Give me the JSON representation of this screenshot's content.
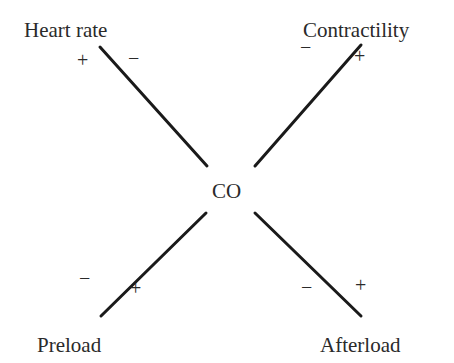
{
  "diagram": {
    "center": {
      "label": "CO",
      "x": 230,
      "y": 192
    },
    "line_color": "#1a1a1a",
    "text_color": "#2a2a2a",
    "nodes": [
      {
        "id": "heart-rate",
        "label": "Heart rate",
        "x": 24,
        "y": 20,
        "line": {
          "x1": 100,
          "y1": 47,
          "x2": 207,
          "y2": 166
        },
        "signs": [
          {
            "s": "+",
            "x": 83,
            "y": 60
          },
          {
            "s": "−",
            "x": 134,
            "y": 58
          }
        ]
      },
      {
        "id": "contractility",
        "label": "Contractility",
        "x": 303,
        "y": 20,
        "line": {
          "x1": 361,
          "y1": 45,
          "x2": 255,
          "y2": 166
        },
        "signs": [
          {
            "s": "−",
            "x": 306,
            "y": 47
          },
          {
            "s": "+",
            "x": 360,
            "y": 56
          }
        ]
      },
      {
        "id": "preload",
        "label": "Preload",
        "x": 37,
        "y": 335,
        "line": {
          "x1": 206,
          "y1": 213,
          "x2": 101,
          "y2": 316
        },
        "signs": [
          {
            "s": "−",
            "x": 85,
            "y": 278
          },
          {
            "s": "+",
            "x": 136,
            "y": 288
          }
        ]
      },
      {
        "id": "afterload",
        "label": "Afterload",
        "x": 320,
        "y": 335,
        "line": {
          "x1": 255,
          "y1": 213,
          "x2": 361,
          "y2": 316
        },
        "signs": [
          {
            "s": "−",
            "x": 307,
            "y": 287
          },
          {
            "s": "+",
            "x": 361,
            "y": 285
          }
        ]
      }
    ]
  }
}
